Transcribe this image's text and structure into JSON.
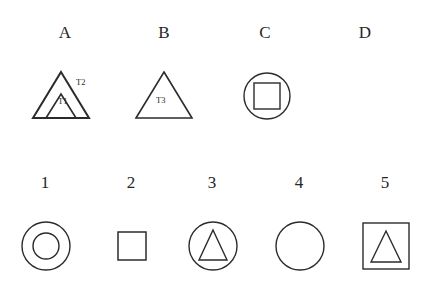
{
  "figure": {
    "width": 426,
    "height": 285,
    "background": "#ffffff",
    "stroke_color": "#2b2b2b",
    "top_row_label": "A B C D",
    "bottom_row_label": "1 2 3 4 5"
  },
  "top_row": {
    "items": [
      {
        "label": "A",
        "label_x": 65,
        "label_y": 24,
        "shape": "triangle-in-triangle",
        "annotations": [
          {
            "text": "T2",
            "x": 76,
            "y": 80
          },
          {
            "text": "T1",
            "x": 58,
            "y": 97
          }
        ]
      },
      {
        "label": "B",
        "label_x": 164,
        "label_y": 24,
        "shape": "triangle",
        "annotations": [
          {
            "text": "T3",
            "x": 156,
            "y": 97
          }
        ]
      },
      {
        "label": "C",
        "label_x": 265,
        "label_y": 24,
        "shape": "square-in-circle",
        "annotations": []
      },
      {
        "label": "D",
        "label_x": 365,
        "label_y": 24,
        "shape": "none",
        "annotations": []
      }
    ]
  },
  "bottom_row": {
    "items": [
      {
        "label": "1",
        "label_x": 45,
        "label_y": 174,
        "shape": "circle-in-circle"
      },
      {
        "label": "2",
        "label_x": 131,
        "label_y": 174,
        "shape": "square"
      },
      {
        "label": "3",
        "label_x": 212,
        "label_y": 174,
        "shape": "triangle-in-circle"
      },
      {
        "label": "4",
        "label_x": 299,
        "label_y": 174,
        "shape": "circle"
      },
      {
        "label": "5",
        "label_x": 385,
        "label_y": 174,
        "shape": "triangle-in-square"
      }
    ]
  }
}
